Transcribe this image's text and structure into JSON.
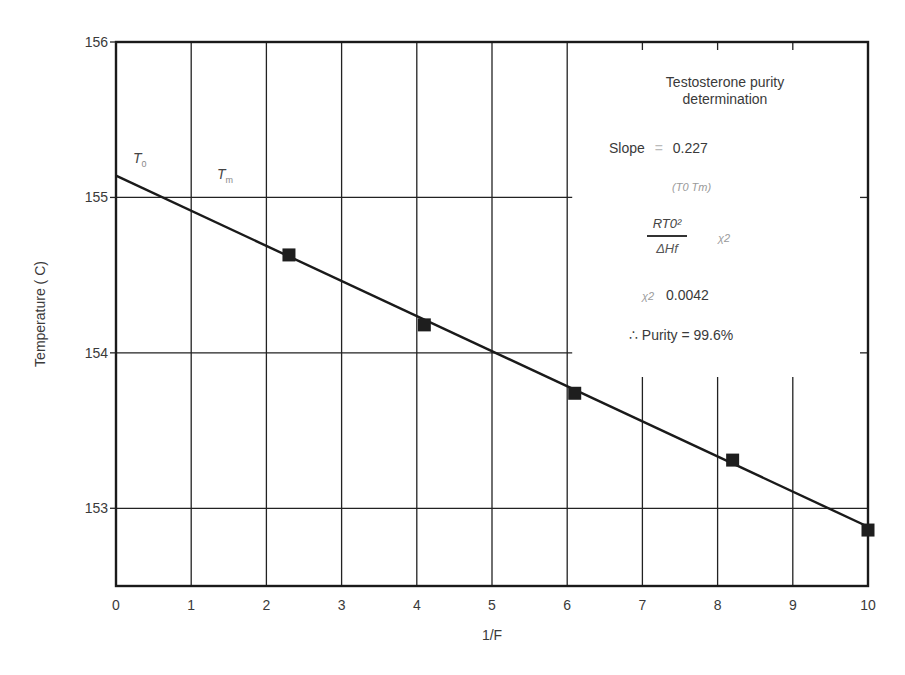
{
  "chart_data": {
    "type": "scatter",
    "title": "Testosterone purity determination",
    "xlabel": "1/F",
    "ylabel": "Temperature (C)",
    "xlim": [
      0,
      10
    ],
    "ylim": [
      152.5,
      156
    ],
    "x_ticks": [
      "0",
      "1",
      "2",
      "3",
      "4",
      "5",
      "6",
      "7",
      "8",
      "9",
      "10"
    ],
    "y_ticks": [
      "153",
      "154",
      "155",
      "156"
    ],
    "grid": true,
    "series": [
      {
        "name": "Measured points",
        "marker": "square",
        "x": [
          2.3,
          4.1,
          6.1,
          8.2,
          10.0
        ],
        "y": [
          154.63,
          154.18,
          153.74,
          153.31,
          152.86
        ]
      },
      {
        "name": "Linear fit",
        "type": "line",
        "x": [
          0,
          10.05
        ],
        "y": [
          155.14,
          152.87
        ]
      }
    ],
    "annotations": [
      "Testosterone purity determination",
      "Slope = 0.227",
      "(T0 − Tm)",
      "RT0² / ΔHf · χ2",
      "χ2 = 0.0042",
      "∴ Purity = 99.6%",
      "T0",
      "Tm"
    ]
  },
  "annotation": {
    "title_line1": "Testosterone purity",
    "title_line2": "determination",
    "slope_label": "Slope",
    "slope_eq": "=",
    "slope_value": "0.227",
    "diff_expr": "(T0  Tm)",
    "frac_num": "RT0²",
    "frac_den": "ΔHf",
    "chi_symbol": "χ2",
    "chi_value": "0.0042",
    "purity": "∴  Purity = 99.6%",
    "t0_label": "T",
    "t0_sub": "0",
    "tm_label": "T",
    "tm_sub": "m"
  },
  "axes": {
    "xlabel": "1/F",
    "ylabel": "Temperature ( C)"
  }
}
